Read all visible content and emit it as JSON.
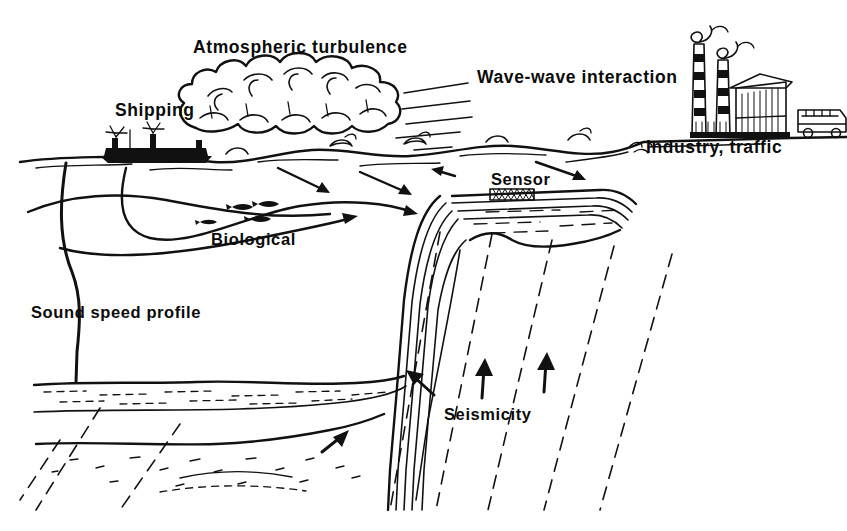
{
  "figure": {
    "style": "hand-drawn pen-and-ink line art, black on white",
    "width": 847,
    "height": 531,
    "ink_color": "#111111",
    "background_color": "#ffffff"
  },
  "labels": {
    "atmospheric_turbulence": "Atmospheric turbulence",
    "shipping": "Shipping",
    "wave_wave_interaction": "Wave-wave interaction",
    "industry_traffic": "Industry, traffic",
    "sensor": "Sensor",
    "biological": "Biological",
    "sound_speed_profile": "Sound speed profile",
    "seismicity": "Seismicity"
  },
  "label_positions": [
    {
      "name": "atmospheric-turbulence",
      "text": "Atmospheric turbulence",
      "x": 193,
      "y": 53,
      "size": "lbl-lg"
    },
    {
      "name": "shipping",
      "text": "Shipping",
      "x": 115,
      "y": 116,
      "size": "lbl-lg"
    },
    {
      "name": "wave-wave-interaction",
      "text": "Wave-wave interaction",
      "x": 477,
      "y": 83,
      "size": "lbl-lg"
    },
    {
      "name": "industry-traffic",
      "text": "Industry, traffic",
      "x": 646,
      "y": 153,
      "size": "lbl-lg"
    },
    {
      "name": "sensor",
      "text": "Sensor",
      "x": 491,
      "y": 185,
      "size": "lbl-md"
    },
    {
      "name": "biological",
      "text": "Biological",
      "x": 211,
      "y": 245,
      "size": "lbl-md"
    },
    {
      "name": "sound-speed-profile",
      "text": "Sound speed profile",
      "x": 31,
      "y": 318,
      "size": "lbl-md"
    },
    {
      "name": "seismicity",
      "text": "Seismicity",
      "x": 444,
      "y": 420,
      "size": "lbl-md"
    }
  ],
  "noise_sources": [
    "Atmospheric turbulence",
    "Shipping",
    "Wave-wave interaction",
    "Industry, traffic",
    "Biological",
    "Seismicity"
  ],
  "pictograms": [
    {
      "name": "cumulus-cloud",
      "description": "large hand-drawn cumulus cloud bank above the sea surface"
    },
    {
      "name": "ship",
      "description": "solid black cargo ship silhouette floating on the sea surface"
    },
    {
      "name": "wind-speed-lines",
      "description": "horizontal motion strokes indicating wind over the waves"
    },
    {
      "name": "fish-school",
      "description": "small black fish glyphs in mid-water"
    },
    {
      "name": "factory",
      "description": "factory building with two striped smokestacks emitting curling smoke"
    },
    {
      "name": "bus",
      "description": "bus or truck on the shoreline indicating road traffic"
    },
    {
      "name": "sensor-device",
      "description": "small cross-hatched rectangle resting on the continental shelf"
    },
    {
      "name": "sound-speed-profile-curve",
      "description": "vertical curve hanging from the ship showing sound speed versus depth"
    },
    {
      "name": "ray-path-arrows",
      "description": "curved arrows showing sound propagation paths converging on the sensor"
    },
    {
      "name": "fault-lines",
      "description": "dashed diagonal lines through the crust representing faults"
    },
    {
      "name": "seismic-arrows",
      "description": "solid black arrows indicating seismic crustal motion"
    },
    {
      "name": "sediment-layers",
      "description": "stratified sediment beds with stipple texture on the deep ocean floor"
    }
  ]
}
